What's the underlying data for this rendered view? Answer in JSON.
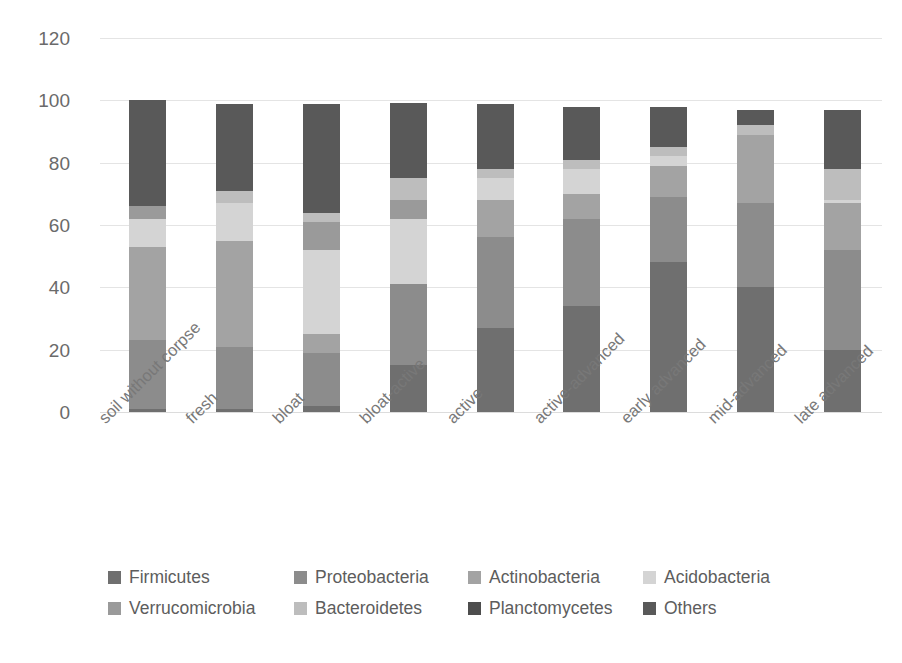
{
  "chart_data": {
    "type": "bar",
    "subtype": "stacked-bar-100",
    "title": "",
    "xlabel": "",
    "ylabel": "proportion of microbiota (%)",
    "ylim": [
      0,
      120
    ],
    "yticks": [
      0,
      20,
      40,
      60,
      80,
      100,
      120
    ],
    "ytick_labels": [
      "0",
      "20",
      "40",
      "60",
      "80",
      "100",
      "120"
    ],
    "grid": true,
    "grid_axis": "y",
    "legend_position": "bottom",
    "categories": [
      "soil without corpse",
      "fresh",
      "bloat",
      "bloat-active",
      "active",
      "active-advanced",
      "early advanced",
      "mid-advanced",
      "late advanced"
    ],
    "series": [
      {
        "name": "Firmicutes",
        "color": "#6f6f6f",
        "values": [
          1,
          1,
          2,
          15,
          27,
          34,
          48,
          40,
          20
        ]
      },
      {
        "name": "Proteobacteria",
        "color": "#8c8c8c",
        "values": [
          22,
          20,
          17,
          26,
          29,
          28,
          21,
          27,
          32
        ]
      },
      {
        "name": "Actinobacteria",
        "color": "#a3a3a3",
        "values": [
          30,
          34,
          6,
          0,
          12,
          8,
          10,
          22,
          15
        ]
      },
      {
        "name": "Acidobacteria",
        "color": "#d4d4d4",
        "values": [
          9,
          12,
          27,
          21,
          7,
          8,
          3,
          0,
          1
        ]
      },
      {
        "name": "Verrucomicrobia",
        "color": "#9a9a9a",
        "values": [
          4,
          0,
          9,
          6,
          0,
          0,
          0,
          0,
          0
        ]
      },
      {
        "name": "Bacteroidetes",
        "color": "#bdbdbd",
        "values": [
          0,
          4,
          3,
          7,
          3,
          3,
          3,
          3,
          10
        ]
      },
      {
        "name": "Planctomycetes",
        "color": "#4d4d4d",
        "values": [
          0,
          0,
          0,
          0,
          0,
          0,
          0,
          0,
          0
        ]
      },
      {
        "name": "Others",
        "color": "#595959",
        "values": [
          34,
          28,
          35,
          24,
          21,
          17,
          13,
          5,
          19
        ]
      }
    ],
    "totals": [
      100,
      99,
      99,
      99,
      99,
      98,
      98,
      97,
      97
    ]
  },
  "axis": {
    "y_title": "proportion of microbiota (%)"
  },
  "legend": {
    "rows": [
      [
        "Firmicutes",
        "Proteobacteria",
        "Actinobacteria",
        "Acidobacteria"
      ],
      [
        "Verrucomicrobia",
        "Bacteroidetes",
        "Planctomycetes",
        "Others"
      ]
    ]
  }
}
